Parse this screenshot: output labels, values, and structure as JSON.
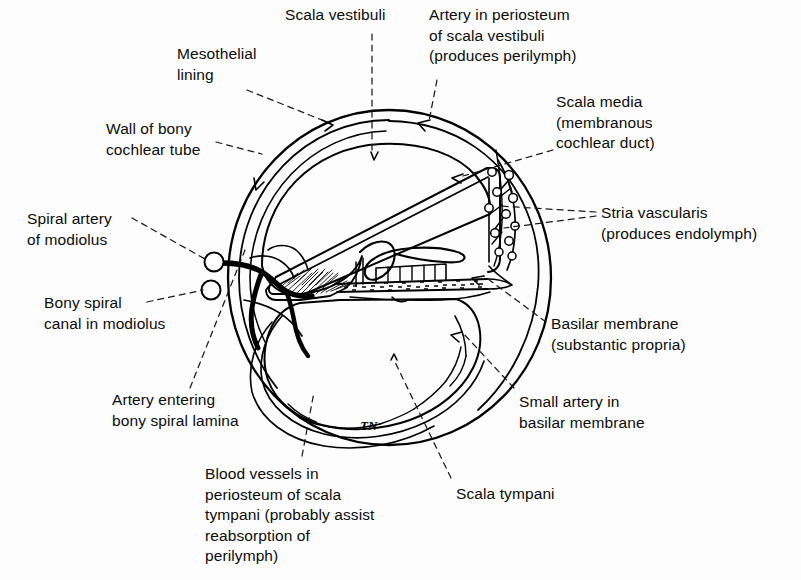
{
  "figure": {
    "artist_signature": "TN",
    "background_color": "#fdfdfd",
    "ink_color": "#000000"
  },
  "labels": {
    "mesothelial_lining": "Mesothelial\nlining",
    "scala_vestibuli": "Scala vestibuli",
    "artery_periosteum_sv": "Artery in periosteum\nof scala vestibuli\n(produces perilymph)",
    "wall_of_bony_cochlear_tube": "Wall of bony\ncochlear tube",
    "scala_media": "Scala media\n(membranous\ncochlear duct)",
    "spiral_artery_of_modiolus": "Spiral artery\nof modiolus",
    "stria_vascularis": "Stria vascularis\n(produces endolymph)",
    "bony_spiral_canal": "Bony spiral\ncanal in modiolus",
    "basilar_membrane": "Basilar membrane\n(substantic propria)",
    "artery_entering_lamina": "Artery entering\nbony spiral lamina",
    "small_artery_basilar": "Small artery in\nbasilar membrane",
    "blood_vessels_periosteum_st": "Blood vessels in\nperiosteum of scala\ntympani (probably assist\nreabsorption of\nperilymph)",
    "scala_tympani": "Scala tympani"
  },
  "label_positions": {
    "mesothelial_lining": {
      "left": 177,
      "top": 44,
      "align": "left"
    },
    "scala_vestibuli": {
      "left": 285,
      "top": 5,
      "align": "left"
    },
    "artery_periosteum_sv": {
      "left": 429,
      "top": 5,
      "align": "left"
    },
    "wall_of_bony_cochlear_tube": {
      "left": 106,
      "top": 119,
      "align": "left"
    },
    "scala_media": {
      "left": 556,
      "top": 92,
      "align": "left"
    },
    "spiral_artery_of_modiolus": {
      "left": 27,
      "top": 209,
      "align": "left"
    },
    "stria_vascularis": {
      "left": 601,
      "top": 203,
      "align": "left"
    },
    "bony_spiral_canal": {
      "left": 44,
      "top": 293,
      "align": "left"
    },
    "basilar_membrane": {
      "left": 551,
      "top": 314,
      "align": "left"
    },
    "artery_entering_lamina": {
      "left": 112,
      "top": 390,
      "align": "left"
    },
    "small_artery_basilar": {
      "left": 519,
      "top": 392,
      "align": "left"
    },
    "blood_vessels_periosteum_st": {
      "left": 205,
      "top": 464,
      "align": "left"
    },
    "scala_tympani": {
      "left": 456,
      "top": 484,
      "align": "left"
    }
  },
  "anatomy_parts": [
    "outer-bony-wall",
    "periosteum-layer",
    "mesothelial-lining-layer",
    "scala-vestibuli-chamber",
    "reissners-membrane",
    "scala-media-triangle",
    "stria-vascularis-band",
    "spiral-limbus",
    "tectorial-membrane",
    "organ-of-corti-hair-cells",
    "basilar-membrane-band",
    "bony-spiral-lamina",
    "spiral-artery-modiolus",
    "bony-spiral-canal-circles",
    "scala-tympani-chamber"
  ]
}
